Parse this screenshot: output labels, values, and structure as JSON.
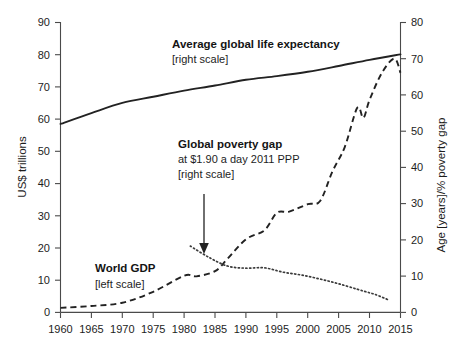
{
  "chart_data": {
    "type": "line",
    "title": "",
    "xlabel": "",
    "ylabel": "US$ trillions",
    "y2label": "Age [years]/% poverty gap",
    "xlim": [
      1960,
      2015
    ],
    "ylim": [
      0,
      90
    ],
    "y2lim": [
      0,
      80
    ],
    "grid": false,
    "legend_position": "inline-annotations",
    "x_ticks": [
      "1960",
      "1965",
      "1970",
      "1975",
      "1980",
      "1985",
      "1990",
      "1995",
      "2000",
      "2005",
      "2010",
      "2015"
    ],
    "y_ticks": [
      "0",
      "10",
      "20",
      "30",
      "40",
      "50",
      "60",
      "70",
      "80",
      "90"
    ],
    "y2_ticks": [
      "0",
      "10",
      "20",
      "30",
      "40",
      "50",
      "60",
      "70",
      "80"
    ],
    "series": [
      {
        "name": "Average global life expectancy",
        "scale": "right",
        "style": "solid",
        "unit": "years",
        "x": [
          1960,
          1965,
          1970,
          1975,
          1980,
          1985,
          1990,
          1995,
          2000,
          2005,
          2010,
          2015
        ],
        "values": [
          52.0,
          55.0,
          57.8,
          59.5,
          61.2,
          62.6,
          64.2,
          65.2,
          66.4,
          68.0,
          69.7,
          71.2
        ]
      },
      {
        "name": "World GDP",
        "scale": "left",
        "style": "dashed",
        "unit": "US$ trillions",
        "x": [
          1960,
          1965,
          1970,
          1975,
          1980,
          1982,
          1985,
          1987,
          1990,
          1993,
          1995,
          1997,
          2000,
          2002,
          2004,
          2006,
          2008,
          2009,
          2010,
          2012,
          2014,
          2015
        ],
        "values": [
          1.4,
          2.0,
          3.0,
          6.4,
          11.4,
          11.2,
          12.8,
          16.6,
          22.7,
          25.5,
          30.9,
          31.3,
          33.6,
          34.6,
          43.8,
          51.4,
          63.5,
          60.4,
          66.0,
          74.4,
          78.8,
          74.4
        ]
      },
      {
        "name": "Global poverty gap at $1.90 a day 2011 PPP",
        "scale": "right",
        "style": "dotted",
        "unit": "% poverty gap",
        "x": [
          1981,
          1984,
          1987,
          1990,
          1993,
          1996,
          1999,
          2002,
          2005,
          2008,
          2010,
          2011,
          2013
        ],
        "values": [
          18.3,
          15.2,
          12.8,
          12.2,
          12.3,
          11.1,
          10.3,
          9.2,
          7.9,
          6.4,
          5.4,
          4.9,
          3.5
        ]
      }
    ],
    "annotations": [
      {
        "id": "life-expectancy",
        "lines": [
          "Average global life expectancy",
          "[right scale]"
        ],
        "bold_lines": 1
      },
      {
        "id": "poverty-gap",
        "lines": [
          "Global poverty gap",
          "at $1.90 a day 2011 PPP",
          "[right scale]"
        ],
        "bold_lines": 1,
        "pointer": true
      },
      {
        "id": "world-gdp",
        "lines": [
          "World GDP",
          "[left scale]"
        ],
        "bold_lines": 1
      }
    ]
  },
  "axes": {
    "left_title": "US$ trillions",
    "right_title": "Age [years]/% poverty gap"
  },
  "labels": {
    "y_0": "0",
    "y_10": "10",
    "y_20": "20",
    "y_30": "30",
    "y_40": "40",
    "y_50": "50",
    "y_60": "60",
    "y_70": "70",
    "y_80": "80",
    "y_90": "90",
    "y2_0": "0",
    "y2_10": "10",
    "y2_20": "20",
    "y2_30": "30",
    "y2_40": "40",
    "y2_50": "50",
    "y2_60": "60",
    "y2_70": "70",
    "y2_80": "80",
    "x_1960": "1960",
    "x_1965": "1965",
    "x_1970": "1970",
    "x_1975": "1975",
    "x_1980": "1980",
    "x_1985": "1985",
    "x_1990": "1990",
    "x_1995": "1995",
    "x_2000": "2000",
    "x_2005": "2005",
    "x_2010": "2010",
    "x_2015": "2015"
  },
  "annotations": {
    "life_title": "Average global life expectancy",
    "life_scale": "[right scale]",
    "poverty_title": "Global poverty gap",
    "poverty_sub": "at $1.90 a day 2011 PPP",
    "poverty_scale": "[right scale]",
    "gdp_title": "World GDP",
    "gdp_scale": "[left scale]"
  },
  "colors": {
    "ink": "#222222",
    "axis": "#4a4a4a",
    "background": "#ffffff"
  }
}
